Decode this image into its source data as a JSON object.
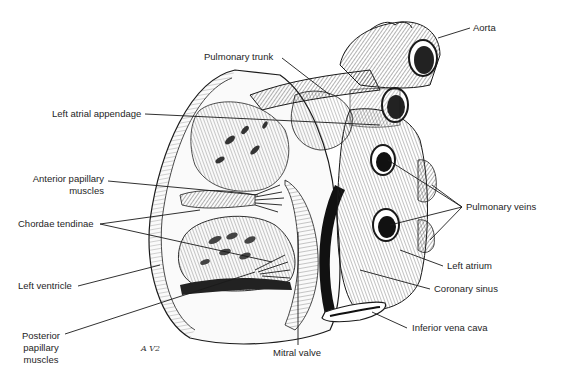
{
  "figure": {
    "artist_signature": "A V2",
    "labels": {
      "aorta": "Aorta",
      "pulmonary_trunk": "Pulmonary trunk",
      "left_atrial_appendage": "Left atrial appendage",
      "anterior_papillary_muscles_line1": "Anterior papillary",
      "anterior_papillary_muscles_line2": "muscles",
      "chordae_tendinae": "Chordae tendinae",
      "pulmonary_veins": "Pulmonary veins",
      "left_ventricle": "Left ventricle",
      "left_atrium": "Left atrium",
      "coronary_sinus": "Coronary sinus",
      "posterior_papillary_muscles_line1": "Posterior",
      "posterior_papillary_muscles_line2": "papillary",
      "posterior_papillary_muscles_line3": "muscles",
      "mitral_valve": "Mitral valve",
      "inferior_vena_cava": "Inferior vena cava"
    },
    "colors": {
      "ink": "#1a1a1a",
      "background": "#ffffff",
      "shade": "#555555"
    }
  }
}
